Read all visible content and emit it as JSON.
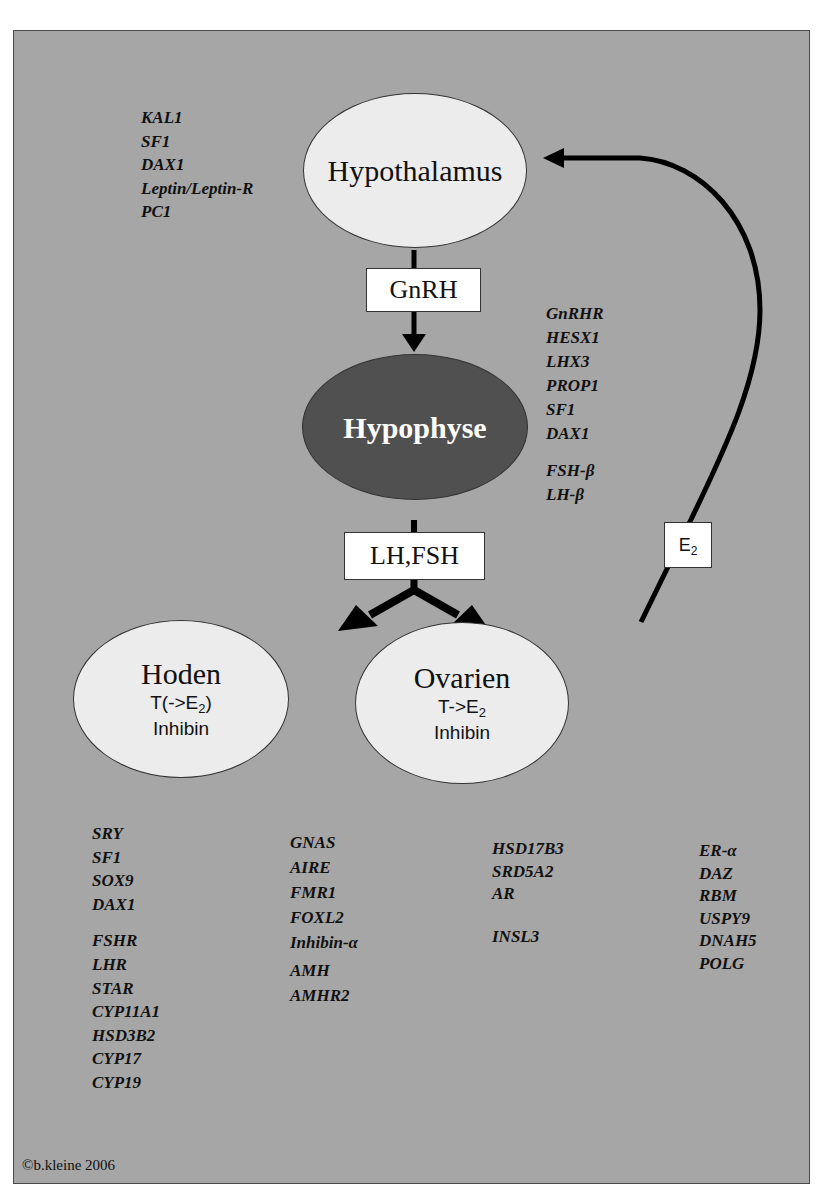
{
  "diagram": {
    "nodes": {
      "hypothalamus": {
        "label": "Hypothalamus"
      },
      "hypophyse": {
        "label": "Hypophyse"
      },
      "hoden": {
        "label": "Hoden",
        "line1_pre": "T(->E",
        "line1_sub": "2",
        "line1_post": ")",
        "line2": "Inhibin"
      },
      "ovarien": {
        "label": "Ovarien",
        "line1_pre": "T->E",
        "line1_sub": "2",
        "line1_post": "",
        "line2": "Inhibin"
      }
    },
    "hormone_boxes": {
      "gnrh": "GnRH",
      "lh_fsh": "LH,FSH",
      "e2": {
        "base": "E",
        "sub": "2"
      }
    },
    "edges": [
      {
        "from": "hypothalamus",
        "to": "hypophyse",
        "label": "GnRH"
      },
      {
        "from": "hypophyse",
        "to": "hoden",
        "label": "LH,FSH"
      },
      {
        "from": "hypophyse",
        "to": "ovarien",
        "label": "LH,FSH"
      },
      {
        "from": "ovarien",
        "to": "hypothalamus",
        "label": "E2",
        "type": "feedback"
      }
    ],
    "gene_lists": {
      "hypothalamus": [
        "KAL1",
        "SF1",
        "DAX1",
        "Leptin/Leptin-R",
        "PC1"
      ],
      "hypophyse_a": [
        "GnRHR",
        "HESX1",
        "LHX3",
        "PROP1",
        "SF1",
        "DAX1"
      ],
      "hypophyse_b": [
        "FSH-β",
        "LH-β"
      ],
      "col1_a": [
        "SRY",
        "SF1",
        "SOX9",
        "DAX1"
      ],
      "col1_b": [
        "FSHR",
        "LHR",
        "STAR",
        "CYP11A1",
        "HSD3B2",
        "CYP17",
        "CYP19"
      ],
      "col2_a": [
        "GNAS",
        "AIRE",
        "FMR1",
        "FOXL2",
        "Inhibin-α"
      ],
      "col2_b": [
        "AMH",
        "AMHR2"
      ],
      "col3_a": [
        "HSD17B3",
        "SRD5A2",
        "AR"
      ],
      "col3_b": [
        "INSL3"
      ],
      "col4": [
        "ER-α",
        "DAZ",
        "RBM",
        "USPY9",
        "DNAH5",
        "POLG"
      ]
    },
    "copyright": "©b.kleine 2006",
    "colors": {
      "panel_bg": "#a6a6a6",
      "light_ellipse": "#ececec",
      "dark_ellipse": "#505050",
      "arrow": "#000000"
    }
  }
}
